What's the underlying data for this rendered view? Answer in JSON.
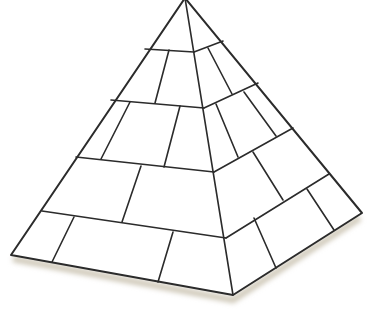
{
  "figure": {
    "description": "Line drawing of a stone block pyramid",
    "stroke_color": "#2b2b2b",
    "fill_color": "#ffffff",
    "shadow_color": "#cfc8b8",
    "vertices": {
      "apex": [
        185,
        -2
      ],
      "left": [
        11,
        255
      ],
      "bottom": [
        233,
        295
      ],
      "right": [
        362,
        213
      ]
    },
    "left_face_courses": [
      [
        [
          145,
          49
        ],
        [
          194,
          52
        ]
      ],
      [
        [
          111,
          100
        ],
        [
          204,
          108
        ]
      ],
      [
        [
          76,
          157
        ],
        [
          214,
          172
        ]
      ],
      [
        [
          42,
          211
        ],
        [
          226,
          238
        ]
      ]
    ],
    "right_face_courses": [
      [
        [
          194,
          52
        ],
        [
          223,
          41
        ]
      ],
      [
        [
          204,
          108
        ],
        [
          258,
          83
        ]
      ],
      [
        [
          214,
          172
        ],
        [
          293,
          128
        ]
      ],
      [
        [
          226,
          238
        ],
        [
          329,
          174
        ]
      ]
    ],
    "left_face_joints": [
      [
        [
          169,
          50
        ],
        [
          155,
          103
        ]
      ],
      [
        [
          130,
          102
        ],
        [
          101,
          159
        ]
      ],
      [
        [
          180,
          106
        ],
        [
          164,
          167
        ]
      ],
      [
        [
          141,
          166
        ],
        [
          122,
          222
        ]
      ],
      [
        [
          74,
          217
        ],
        [
          52,
          262
        ]
      ],
      [
        [
          173,
          232
        ],
        [
          158,
          282
        ]
      ]
    ],
    "right_face_joints": [
      [
        [
          208,
          48
        ],
        [
          232,
          94
        ]
      ],
      [
        [
          216,
          104
        ],
        [
          238,
          157
        ]
      ],
      [
        [
          244,
          92
        ],
        [
          276,
          136
        ]
      ],
      [
        [
          253,
          152
        ],
        [
          283,
          200
        ]
      ],
      [
        [
          254,
          218
        ],
        [
          276,
          268
        ]
      ],
      [
        [
          307,
          189
        ],
        [
          334,
          230
        ]
      ]
    ]
  }
}
